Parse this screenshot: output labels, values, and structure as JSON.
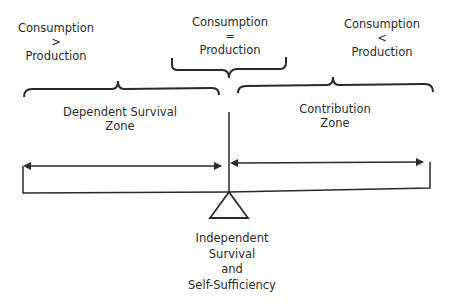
{
  "diagram": {
    "top_labels": {
      "left": {
        "line1": "Consumption",
        "operator": ">",
        "line2": "Production"
      },
      "center": {
        "line1": "Consumption",
        "operator": "=",
        "line2": "Production"
      },
      "right": {
        "line1": "Consumption",
        "operator": "<",
        "line2": "Production"
      }
    },
    "zones": {
      "left": {
        "line1": "Dependent Survival",
        "line2": "Zone"
      },
      "right": {
        "line1": "Contribution",
        "line2": "Zone"
      }
    },
    "fulcrum_label": {
      "line1": "Independent",
      "line2": "Survival",
      "line3": "and",
      "line4": "Self-Sufficiency"
    },
    "colors": {
      "stroke": "#2a2a2a",
      "background": "#ffffff",
      "text": "#2b2b2b"
    }
  }
}
